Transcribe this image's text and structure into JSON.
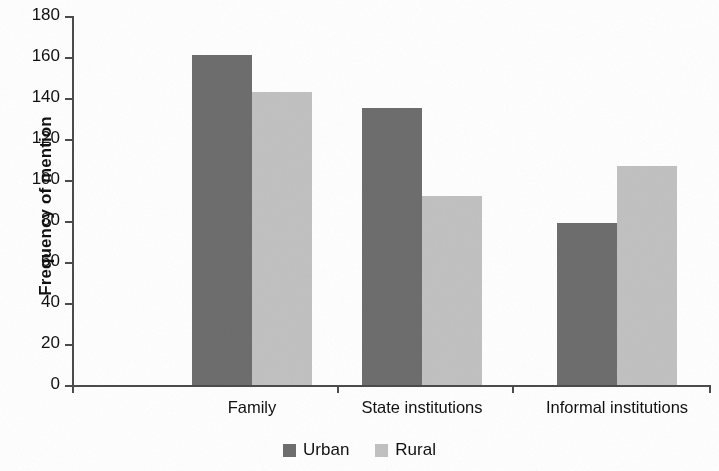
{
  "chart_data": {
    "type": "bar",
    "title": "",
    "subtitle": "",
    "xlabel": "",
    "ylabel": "Frequency of mention",
    "categories": [
      "Family",
      "State institutions",
      "Informal institutions"
    ],
    "series": [
      {
        "name": "Urban",
        "color": "#6e6e6e",
        "values": [
          161,
          135,
          79
        ]
      },
      {
        "name": "Rural",
        "color": "#c2c2c2",
        "values": [
          143,
          92,
          107
        ]
      }
    ],
    "ylim": [
      0,
      180
    ],
    "ytick_values": [
      0,
      20,
      40,
      60,
      80,
      100,
      120,
      140,
      160,
      180
    ],
    "ytick_labels": [
      "0",
      "20",
      "40",
      "60",
      "80",
      "100",
      "120",
      "140",
      "160",
      "180"
    ],
    "grid": false,
    "legend_position": "bottom-center",
    "legend_entries": [
      "Urban",
      "Rural"
    ]
  },
  "axis": {
    "y_title": "Frequency of mention"
  },
  "legend": {
    "items": [
      {
        "label": "Urban"
      },
      {
        "label": "Rural"
      }
    ]
  }
}
